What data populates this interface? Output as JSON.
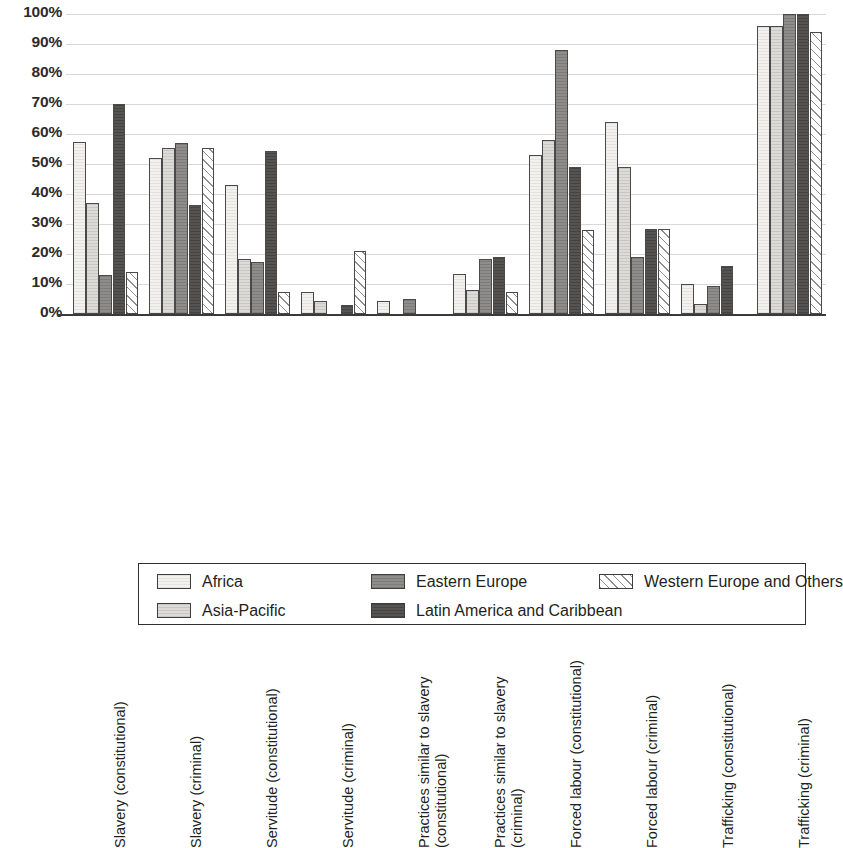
{
  "chart_data": {
    "type": "bar",
    "title": "",
    "subtitle": "",
    "xlabel": "",
    "ylabel": "",
    "ylim": [
      0,
      100
    ],
    "ytick_labels": [
      "100%",
      "90%",
      "80%",
      "70%",
      "60%",
      "50%",
      "40%",
      "30%",
      "20%",
      "10%",
      "0%"
    ],
    "ytick_values": [
      100,
      90,
      80,
      70,
      60,
      50,
      40,
      30,
      20,
      10,
      0
    ],
    "grid": true,
    "legend_position": "bottom",
    "categories": [
      "Slavery (constitutional)",
      "Slavery (criminal)",
      "Servitude (constitutional)",
      "Servitude (criminal)",
      "Practices similar to slavery\n(constitutional)",
      "Practices similar to slavery\n(criminal)",
      "Forced labour (constitutional)",
      "Forced labour (criminal)",
      "Trafficking (constitutional)",
      "Trafficking (criminal)"
    ],
    "series": [
      {
        "name": "Africa",
        "color": "#f2f1ee",
        "values": [
          57.5,
          52,
          43,
          7.5,
          4.5,
          13.5,
          53,
          64,
          10,
          96
        ]
      },
      {
        "name": "Asia-Pacific",
        "color": "#dddbd7",
        "values": [
          37,
          55.5,
          18.5,
          4.5,
          0,
          8,
          58,
          49,
          3.5,
          96
        ]
      },
      {
        "name": "Eastern Europe",
        "color": "#8e8d8a",
        "values": [
          13,
          57,
          17.5,
          0,
          5,
          18.5,
          88,
          19,
          9.5,
          100
        ]
      },
      {
        "name": "Latin America and Caribbean",
        "color": "#555452",
        "values": [
          70,
          36.5,
          54.5,
          3,
          0,
          19,
          49,
          28.5,
          16,
          100
        ]
      },
      {
        "name": "Western Europe and Others",
        "color": "#ffffff",
        "values": [
          14,
          55.5,
          7.5,
          21,
          0,
          7.5,
          28,
          28.5,
          0,
          94
        ]
      }
    ]
  },
  "legend": {
    "entries": [
      {
        "label": "Africa"
      },
      {
        "label": "Asia-Pacific"
      },
      {
        "label": "Eastern Europe"
      },
      {
        "label": "Latin America and Caribbean"
      },
      {
        "label": "Western Europe and Others"
      }
    ]
  }
}
